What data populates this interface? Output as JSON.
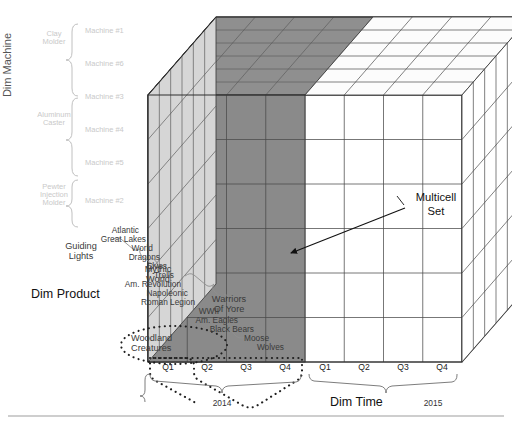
{
  "figure": {
    "callout": "Multicell\nSet",
    "callout_line1": "Multicell",
    "callout_line2": "Set"
  },
  "dimensions": {
    "machine_axis_label": "Dim Machine",
    "product_axis_label": "Dim Product",
    "time_axis_label": "Dim Time"
  },
  "machine": {
    "groups": [
      {
        "label": "Clay\nMolder",
        "line1": "Clay",
        "line2": "Molder"
      },
      {
        "label": "Aluminum\nCaster",
        "line1": "Aluminum",
        "line2": "Caster"
      },
      {
        "label": "Pewter\nInjection\nMolder",
        "line1": "Pewter",
        "line2": "Injection",
        "line3": "Molder"
      }
    ],
    "items": [
      "Machine #1",
      "Machine #6",
      "Machine #3",
      "Machine #4",
      "Machine #5",
      "Machine #2"
    ]
  },
  "product": {
    "groups": [
      {
        "label": "Guiding\nLights",
        "line1": "Guiding",
        "line2": "Lights"
      },
      {
        "label": "Mythic\nWorld",
        "line1": "Mythic",
        "line2": "World"
      },
      {
        "label": "Warriors\nOf Yore",
        "line1": "Warriors",
        "line2": "Of Yore"
      },
      {
        "label": "Woodland\nCreatures",
        "line1": "Woodland",
        "line2": "Creatures"
      }
    ],
    "items": [
      "Atlantic",
      "Great Lakes",
      "World",
      "Dragons",
      "Elves",
      "Trolls",
      "Am. Revolution",
      "Napoleonic",
      "Roman Legion",
      "WWII",
      "Am. Eagles",
      "Black Bears",
      "Moose",
      "Wolves"
    ]
  },
  "time": {
    "years": [
      "2014",
      "2015"
    ],
    "quarters_2014": [
      "Q1",
      "Q2",
      "Q3",
      "Q4"
    ],
    "quarters_2015": [
      "Q1",
      "Q2",
      "Q3",
      "Q4"
    ],
    "all_quarter_ticks": [
      "Q1",
      "Q2",
      "Q3",
      "Q4",
      "Q1",
      "Q2",
      "Q3",
      "Q4"
    ]
  },
  "colors": {
    "selection_fill": "#818181",
    "selection_top": "#6e6e6e",
    "cube_front": "#ffffff",
    "cube_side": "#d3d3d3",
    "cube_top": "#fbfbfb",
    "stroke": "#3c3c3c",
    "faint_label": "#c9c9c9"
  },
  "selection": {
    "description": "Multicell set spanning 2014 Q1-Q4 across all machines and selected products",
    "selected_quarters": [
      "Q1",
      "Q2",
      "Q3",
      "Q4"
    ],
    "selected_year": "2014"
  }
}
